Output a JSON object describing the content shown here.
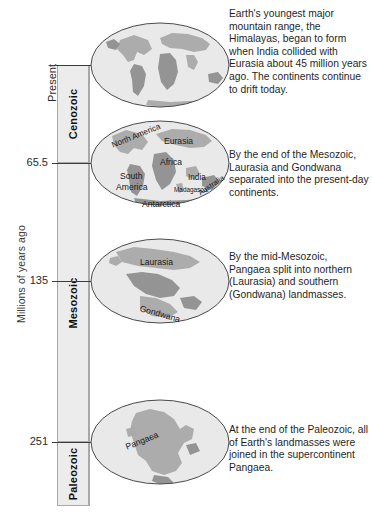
{
  "axis": {
    "title": "Millions of years ago",
    "ticks": [
      {
        "label": "Present",
        "y": 65,
        "rotated": true
      },
      {
        "label": "65.5",
        "y": 163,
        "rotated": false
      },
      {
        "label": "135",
        "y": 281,
        "rotated": false
      },
      {
        "label": "251",
        "y": 442,
        "rotated": false
      }
    ]
  },
  "eras": [
    {
      "name": "Cenozoic",
      "top": 65,
      "bottom": 163
    },
    {
      "name": "Mesozoic",
      "top": 163,
      "bottom": 442
    },
    {
      "name": "Paleozoic",
      "top": 442,
      "bottom": 506
    }
  ],
  "globes": [
    {
      "id": "globe-present",
      "equator_y": 65,
      "labels": []
    },
    {
      "id": "globe-65",
      "equator_y": 163,
      "labels": [
        {
          "text": "North America",
          "x": 22,
          "y": 26,
          "size": 8.2,
          "rotate": -22
        },
        {
          "text": "Eurasia",
          "x": 74,
          "y": 21,
          "size": 8.6,
          "rotate": 0
        },
        {
          "text": "Africa",
          "x": 70,
          "y": 42,
          "size": 8.6,
          "rotate": 0
        },
        {
          "text": "India",
          "x": 98,
          "y": 58,
          "size": 8.2,
          "rotate": 0
        },
        {
          "text": "South",
          "x": 30,
          "y": 56,
          "size": 8.6,
          "rotate": 0
        },
        {
          "text": "America",
          "x": 26,
          "y": 67,
          "size": 8.6,
          "rotate": 0
        },
        {
          "text": "Madagascar",
          "x": 84,
          "y": 70,
          "size": 6.4,
          "rotate": 0
        },
        {
          "text": "Australia",
          "x": 109,
          "y": 74,
          "size": 7.6,
          "rotate": -34
        },
        {
          "text": "Antarctica",
          "x": 52,
          "y": 84,
          "size": 8.6,
          "rotate": 0
        }
      ]
    },
    {
      "id": "globe-135",
      "equator_y": 281,
      "labels": [
        {
          "text": "Laurasia",
          "x": 50,
          "y": 24,
          "size": 8.6,
          "rotate": 0
        },
        {
          "text": "Gondwana",
          "x": 50,
          "y": 70,
          "size": 8.6,
          "rotate": 16
        }
      ]
    },
    {
      "id": "globe-251",
      "equator_y": 442,
      "labels": [
        {
          "text": "Pangaea",
          "x": 36,
          "y": 48,
          "size": 8.6,
          "rotate": -22
        }
      ]
    }
  ],
  "captions": [
    {
      "id": "caption-present",
      "top": 8,
      "text": "Earth's youngest major mountain range, the Himalayas, began to form when India collided with Eurasia about 45 million years ago. The continents continue to drift today."
    },
    {
      "id": "caption-65",
      "top": 149,
      "text": "By the end of the Mesozoic, Laurasia and Gondwana separated into the present-day continents."
    },
    {
      "id": "caption-135",
      "top": 251,
      "text": "By the mid-Mesozoic, Pangaea split into northern (Laurasia) and southern (Gondwana) landmasses."
    },
    {
      "id": "caption-251",
      "top": 424,
      "text": "At the end of the Paleozoic, all of Earth's landmasses were joined in the supercontinent Pangaea."
    }
  ],
  "colors": {
    "ocean": "#e9e9e9",
    "land": "#a9a9a9",
    "land_dark": "#8f8f8f",
    "outline": "#4a4a4a",
    "era_fill": "#ececec",
    "era_border": "#a8a8a8",
    "rule": "#3c3c3c",
    "text": "#1f1f1f"
  }
}
